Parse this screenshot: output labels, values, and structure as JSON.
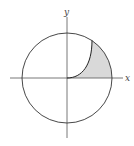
{
  "figure": {
    "axes": {
      "x_label": "x",
      "y_label": "y"
    },
    "shapes": {
      "outer_circle": "circle centered at origin",
      "inner_curve": "curve from origin to circle in first quadrant",
      "shaded_region": "region between inner curve and outer circle above x-axis in first quadrant"
    },
    "colors": {
      "stroke": "#333333",
      "axis": "#555555",
      "shade": "#d9d9d9"
    }
  }
}
